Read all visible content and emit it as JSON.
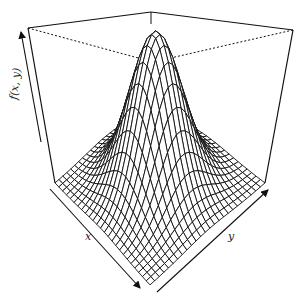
{
  "chart_data": {
    "type": "surface3d",
    "title": "",
    "xlabel": "x",
    "ylabel": "y",
    "zlabel": "f(x, y)",
    "function": "bivariate normal density (peaked at origin)",
    "grid_size": 25,
    "x_range": [
      -3,
      3
    ],
    "y_range": [
      -3,
      3
    ],
    "peak": {
      "x": 0,
      "y": 0,
      "z": 1.0
    },
    "box": true,
    "ticks": false,
    "colors": {
      "line": "#111111",
      "background": "#ffffff"
    }
  },
  "axes": {
    "x_label": "x",
    "y_label": "y",
    "z_label": "f(x, y)"
  }
}
